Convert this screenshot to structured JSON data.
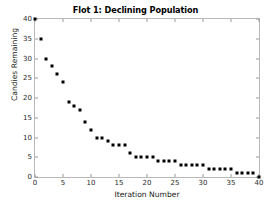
{
  "chart_data": {
    "type": "scatter",
    "title": "Flot 1: Declining Population",
    "xlabel": "Iteration Number",
    "ylabel": "Candies Remaining",
    "xlim": [
      0,
      40
    ],
    "ylim": [
      0,
      40
    ],
    "xticks": [
      0,
      5,
      10,
      15,
      20,
      25,
      30,
      35,
      40
    ],
    "yticks": [
      0,
      5,
      10,
      15,
      20,
      25,
      30,
      35,
      40
    ],
    "grid": false,
    "legend": null,
    "marker": "square",
    "marker_color": "#000000",
    "x": [
      0,
      1,
      2,
      3,
      4,
      5,
      6,
      7,
      8,
      9,
      10,
      11,
      12,
      13,
      14,
      15,
      16,
      17,
      18,
      19,
      20,
      21,
      22,
      23,
      24,
      25,
      26,
      27,
      28,
      29,
      30,
      31,
      32,
      33,
      34,
      35,
      36,
      37,
      38,
      39,
      40
    ],
    "values": [
      40,
      35,
      30,
      28,
      26,
      24,
      19,
      18,
      17,
      14,
      12,
      10,
      10,
      9,
      8,
      8,
      8,
      6,
      5,
      5,
      5,
      5,
      4,
      4,
      4,
      4,
      3,
      3,
      3,
      3,
      3,
      2,
      2,
      2,
      2,
      2,
      1,
      1,
      1,
      1,
      0
    ]
  }
}
